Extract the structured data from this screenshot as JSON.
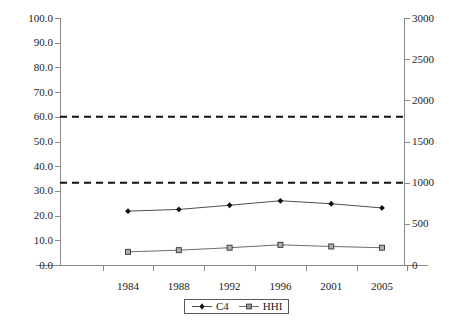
{
  "chart_data": {
    "type": "line",
    "title": "",
    "subtitle": "",
    "xlabel": "",
    "ylabel": "",
    "categories": [
      "1984",
      "1988",
      "1992",
      "1996",
      "2001",
      "2005"
    ],
    "x": [
      1984,
      1988,
      1992,
      1996,
      2001,
      2005
    ],
    "grid": false,
    "legend_position": "bottom-center",
    "axes": {
      "left": {
        "label": "",
        "ylim": [
          0.0,
          100.0
        ],
        "tick_step": 10.0,
        "tick_labels": [
          "0.0",
          "10.0",
          "20.0",
          "30.0",
          "40.0",
          "50.0",
          "60.0",
          "70.0",
          "80.0",
          "90.0",
          "100.0"
        ],
        "tick_values": [
          0.0,
          10.0,
          20.0,
          30.0,
          40.0,
          50.0,
          60.0,
          70.0,
          80.0,
          90.0,
          100.0
        ]
      },
      "right": {
        "label": "",
        "ylim": [
          0,
          3000
        ],
        "tick_step": 500,
        "tick_labels": [
          "0",
          "500",
          "1000",
          "1500",
          "2000",
          "2500",
          "3000"
        ],
        "tick_values": [
          0,
          500,
          1000,
          1500,
          2000,
          2500,
          3000
        ]
      }
    },
    "series": [
      {
        "name": "C4",
        "axis": "left",
        "marker": "diamond",
        "line_style": "solid",
        "color": "#4d4d4d",
        "values": [
          21.8,
          22.5,
          24.2,
          26.0,
          24.8,
          23.1
        ]
      },
      {
        "name": "HHI",
        "axis": "right",
        "marker": "square",
        "line_style": "solid",
        "color": "#6e6e6e",
        "values": [
          160,
          180,
          210,
          245,
          225,
          210
        ]
      }
    ],
    "reference_lines": [
      {
        "name": "upper-threshold",
        "left_axis_value": 60.0,
        "right_axis_value": 1800,
        "style": "dashed",
        "color": "#111111"
      },
      {
        "name": "lower-threshold",
        "left_axis_value": 33.3,
        "right_axis_value": 1000,
        "style": "dashed",
        "color": "#111111"
      }
    ],
    "legend": [
      {
        "label": "C4",
        "marker": "diamond"
      },
      {
        "label": "HHI",
        "marker": "square"
      }
    ]
  },
  "colors": {
    "axis": "#8a8a8a",
    "text": "#1a1a1a",
    "c4_line": "#4d4d4d",
    "hhi_line": "#6e6e6e",
    "reference_line": "#111111",
    "background": "#ffffff"
  }
}
